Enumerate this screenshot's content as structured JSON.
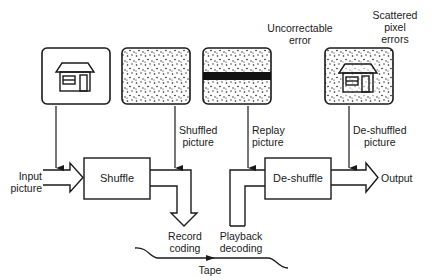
{
  "diagram": {
    "type": "block-diagram",
    "title": "",
    "colors": {
      "stroke": "#1a1a1a",
      "background": "#ffffff",
      "band": "#111111"
    },
    "pictures": [
      {
        "id": "input",
        "content": "house",
        "noise": false
      },
      {
        "id": "shuffled",
        "content": "noise",
        "noise": true
      },
      {
        "id": "replay",
        "content": "noise-with-band",
        "noise": true
      },
      {
        "id": "deshuffled",
        "content": "house",
        "noise": true
      }
    ],
    "annotations": {
      "uncorrectable_line1": "Uncorrectable",
      "uncorrectable_line2": "error",
      "scattered_line1": "Scattered",
      "scattered_line2": "pixel",
      "scattered_line3": "errors"
    },
    "labels": {
      "input_line1": "Input",
      "input_line2": "picture",
      "shuffled_line1": "Shuffled",
      "shuffled_line2": "picture",
      "replay_line1": "Replay",
      "replay_line2": "picture",
      "deshuffled_line1": "De-shuffled",
      "deshuffled_line2": "picture",
      "output": "Output",
      "record_line1": "Record",
      "record_line2": "coding",
      "playback_line1": "Playback",
      "playback_line2": "decoding",
      "tape": "Tape"
    },
    "blocks": {
      "shuffle": "Shuffle",
      "deshuffle": "De-shuffle"
    }
  }
}
